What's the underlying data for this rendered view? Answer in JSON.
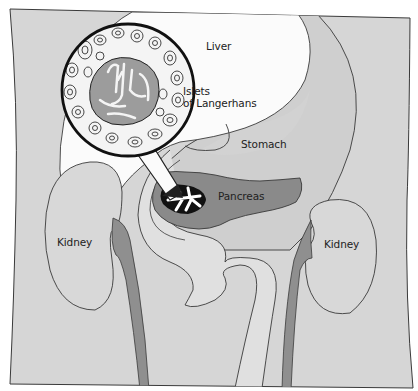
{
  "figure": {
    "type": "anatomical-diagram"
  },
  "labels": {
    "liver": "Liver",
    "islets_line1": "Islets",
    "islets_line2": "of Langerhans",
    "stomach": "Stomach",
    "pancreas": "Pancreas",
    "kidney_left": "Kidney",
    "kidney_right": "Kidney"
  },
  "colors": {
    "background": "#ffffff",
    "body": "#d6d6d6",
    "liver": "#fbfbfb",
    "stomach": "#d0d0d0",
    "pancreas": "#8a8a8a",
    "vessel": "#8f8f8f",
    "outline": "#3a3a3a",
    "magnifier_ring": "#111111"
  }
}
